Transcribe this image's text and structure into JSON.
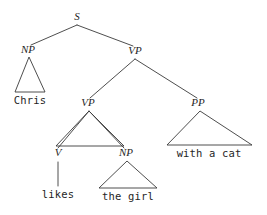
{
  "figure": {
    "kind": "syntax-tree",
    "sentence": "Chris likes the girl with a cat",
    "background_color": "#ffffff",
    "line_color": "#3a3a3a",
    "text_color": "#1f1f1f",
    "width": 267,
    "height": 215
  },
  "nodes": [
    {
      "id": "s",
      "label": "S",
      "x": 77,
      "y": 20,
      "anchor_x": 77,
      "anchor_y": 25
    },
    {
      "id": "np1",
      "label": "NP",
      "x": 28,
      "y": 53,
      "anchor_x": 29,
      "anchor_y": 57
    },
    {
      "id": "vp_top",
      "label": "VP",
      "x": 135,
      "y": 54,
      "anchor_x": 135,
      "anchor_y": 59
    },
    {
      "id": "vp_in",
      "label": "VP",
      "x": 88,
      "y": 106,
      "anchor_x": 89,
      "anchor_y": 111
    },
    {
      "id": "pp",
      "label": "PP",
      "x": 198,
      "y": 106,
      "anchor_x": 200,
      "anchor_y": 111
    },
    {
      "id": "v",
      "label": "V",
      "x": 58,
      "y": 156,
      "anchor_x": 58,
      "anchor_y": 161
    },
    {
      "id": "np2",
      "label": "NP",
      "x": 126,
      "y": 156,
      "anchor_x": 127,
      "anchor_y": 161
    }
  ],
  "edges": [
    {
      "id": "edge-s-np1",
      "from": "S",
      "to": "NP",
      "x1": 77,
      "y1": 25,
      "x2": 31,
      "y2": 45
    },
    {
      "id": "edge-s-vp",
      "from": "S",
      "to": "VP",
      "x1": 77,
      "y1": 25,
      "x2": 133,
      "y2": 46
    },
    {
      "id": "edge-vp-vp",
      "from": "VP",
      "to": "VP",
      "x1": 135,
      "y1": 59,
      "x2": 90,
      "y2": 98
    },
    {
      "id": "edge-vp-pp",
      "from": "VP",
      "to": "PP",
      "x1": 135,
      "y1": 59,
      "x2": 197,
      "y2": 98
    },
    {
      "id": "edge-vp-v",
      "from": "VP",
      "to": "V",
      "x1": 89,
      "y1": 111,
      "x2": 58,
      "y2": 148
    },
    {
      "id": "edge-vp-np",
      "from": "VP",
      "to": "NP",
      "x1": 89,
      "y1": 111,
      "x2": 124,
      "y2": 148
    },
    {
      "id": "edge-v-likes",
      "from": "V",
      "to": "likes",
      "x1": 58,
      "y1": 162,
      "x2": 58,
      "y2": 186
    }
  ],
  "triangles": [
    {
      "id": "tri-np1",
      "label": "NP",
      "apex_x": 29,
      "apex_y": 57,
      "left_x": 15,
      "right_x": 45,
      "base_y": 92
    },
    {
      "id": "tri-vp-in",
      "label": "VP",
      "apex_x": 89,
      "apex_y": 111,
      "left_x": 56,
      "right_x": 124,
      "base_y": 146
    },
    {
      "id": "tri-pp",
      "label": "PP",
      "apex_x": 200,
      "apex_y": 111,
      "left_x": 167,
      "right_x": 252,
      "base_y": 145
    },
    {
      "id": "tri-np2",
      "label": "NP",
      "apex_x": 127,
      "apex_y": 161,
      "left_x": 99,
      "right_x": 157,
      "base_y": 188
    }
  ],
  "leaves": [
    {
      "id": "leaf-chris",
      "text": "Chris",
      "x": 30,
      "y": 104
    },
    {
      "id": "leaf-with",
      "text": "with a cat",
      "x": 209,
      "y": 157
    },
    {
      "id": "leaf-likes",
      "text": "likes",
      "x": 58,
      "y": 198
    },
    {
      "id": "leaf-the-girl",
      "text": "the girl",
      "x": 128,
      "y": 200
    }
  ]
}
